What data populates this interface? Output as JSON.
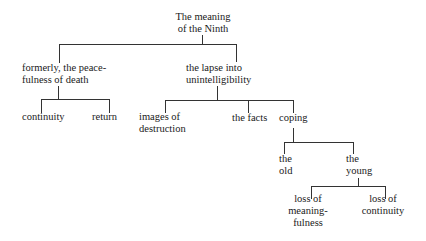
{
  "diagram": {
    "type": "tree",
    "line_color": "#333333",
    "root": {
      "id": "root",
      "lines": [
        "The meaning",
        "of the Ninth"
      ],
      "children": [
        {
          "id": "formerly",
          "lines": [
            "formerly, the peace-",
            "fulness of death"
          ],
          "children": [
            {
              "id": "continuity",
              "lines": [
                "continuity"
              ]
            },
            {
              "id": "return",
              "lines": [
                "return"
              ]
            }
          ]
        },
        {
          "id": "lapse",
          "lines": [
            "the lapse into",
            "unintelligibility"
          ],
          "children": [
            {
              "id": "images",
              "lines": [
                "images of",
                "destruction"
              ]
            },
            {
              "id": "facts",
              "lines": [
                "the facts"
              ]
            },
            {
              "id": "coping",
              "lines": [
                "coping"
              ],
              "children": [
                {
                  "id": "old",
                  "lines": [
                    "the",
                    "old"
                  ]
                },
                {
                  "id": "young",
                  "lines": [
                    "the",
                    "young"
                  ],
                  "children": [
                    {
                      "id": "loss-meaning",
                      "lines": [
                        "loss of",
                        "meaning-",
                        "fulness"
                      ]
                    },
                    {
                      "id": "loss-continuity",
                      "lines": [
                        "loss of",
                        "continuity"
                      ]
                    }
                  ]
                }
              ]
            }
          ]
        }
      ]
    }
  },
  "nodes": {
    "root": [
      "The meaning",
      "of the Ninth"
    ],
    "formerly": [
      "formerly, the peace-",
      "fulness of death"
    ],
    "lapse": [
      "the lapse into",
      "unintelligibility"
    ],
    "continuity": [
      "continuity"
    ],
    "return": [
      "return"
    ],
    "images": [
      "images of",
      "destruction"
    ],
    "facts": [
      "the facts"
    ],
    "coping": [
      "coping"
    ],
    "old": [
      "the",
      "old"
    ],
    "young": [
      "the",
      "young"
    ],
    "loss_meaning": [
      "loss of",
      "meaning-",
      "fulness"
    ],
    "loss_continuity": [
      "loss of",
      "continuity"
    ]
  }
}
